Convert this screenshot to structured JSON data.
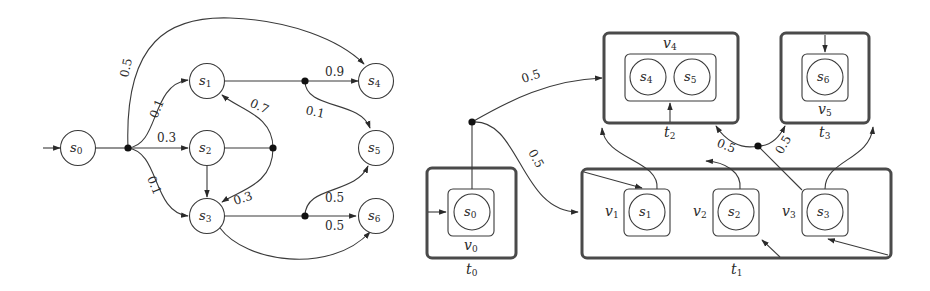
{
  "left_diagram": {
    "title": "probabilistic-automaton",
    "states": [
      {
        "id": "s0",
        "name": "s",
        "sub": "0"
      },
      {
        "id": "s1",
        "name": "s",
        "sub": "1"
      },
      {
        "id": "s2",
        "name": "s",
        "sub": "2"
      },
      {
        "id": "s3",
        "name": "s",
        "sub": "3"
      },
      {
        "id": "s4",
        "name": "s",
        "sub": "4"
      },
      {
        "id": "s5",
        "name": "s",
        "sub": "5"
      },
      {
        "id": "s6",
        "name": "s",
        "sub": "6"
      }
    ],
    "edges": [
      {
        "from": "s0",
        "to": "junction-a",
        "label": ""
      },
      {
        "from": "junction-a",
        "to": "s4",
        "label": "0.5"
      },
      {
        "from": "junction-a",
        "to": "s1",
        "label": "0.1"
      },
      {
        "from": "junction-a",
        "to": "s2",
        "label": "0.3"
      },
      {
        "from": "junction-a",
        "to": "s3",
        "label": "0.1"
      },
      {
        "from": "s1",
        "to": "junction-b",
        "label": ""
      },
      {
        "from": "junction-b",
        "to": "s4",
        "label": "0.9"
      },
      {
        "from": "junction-b",
        "to": "s5",
        "label": "0.1"
      },
      {
        "from": "s2",
        "to": "junction-c",
        "label": ""
      },
      {
        "from": "junction-c",
        "to": "s1",
        "label": "0.7"
      },
      {
        "from": "junction-c",
        "to": "s3",
        "label": "0.3"
      },
      {
        "from": "s2",
        "to": "s3",
        "label": ""
      },
      {
        "from": "s3",
        "to": "junction-d",
        "label": ""
      },
      {
        "from": "junction-d",
        "to": "s5",
        "label": "0.5"
      },
      {
        "from": "junction-d",
        "to": "s6",
        "label": "0.5"
      },
      {
        "from": "s3",
        "to": "s6",
        "label": ""
      }
    ],
    "labels": {
      "p_s4": "0.5",
      "p_s1": "0.1",
      "p_s2": "0.3",
      "p_s3": "0.1",
      "p_09": "0.9",
      "p_01": "0.1",
      "p_07": "0.7",
      "p_03": "0.3",
      "p_05a": "0.5",
      "p_05b": "0.5"
    }
  },
  "right_diagram": {
    "title": "quotient-structure",
    "boxes": [
      {
        "id": "t0",
        "label": "t",
        "sub": "0",
        "inner": [
          {
            "id": "v0",
            "label": "v",
            "sub": "0",
            "states": [
              "s0"
            ]
          }
        ]
      },
      {
        "id": "t1",
        "label": "t",
        "sub": "1",
        "inner": [
          {
            "id": "v1",
            "label": "v",
            "sub": "1",
            "states": [
              "s1"
            ]
          },
          {
            "id": "v2",
            "label": "v",
            "sub": "2",
            "states": [
              "s2"
            ]
          },
          {
            "id": "v3",
            "label": "v",
            "sub": "3",
            "states": [
              "s3"
            ]
          }
        ]
      },
      {
        "id": "t2",
        "label": "t",
        "sub": "2",
        "inner": [
          {
            "id": "v4",
            "label": "v",
            "sub": "4",
            "states": [
              "s4",
              "s5"
            ]
          }
        ]
      },
      {
        "id": "t3",
        "label": "t",
        "sub": "3",
        "inner": [
          {
            "id": "v5",
            "label": "v",
            "sub": "5",
            "states": [
              "s6"
            ]
          }
        ]
      }
    ],
    "labels": {
      "p_t2": "0.5",
      "p_t1": "0.5",
      "p_left": "0.5",
      "p_right": "0.5"
    }
  },
  "text": {
    "s": "s",
    "v": "v",
    "t": "t",
    "sub0": "0",
    "sub1": "1",
    "sub2": "2",
    "sub3": "3",
    "sub4": "4",
    "sub5": "5",
    "sub6": "6"
  }
}
